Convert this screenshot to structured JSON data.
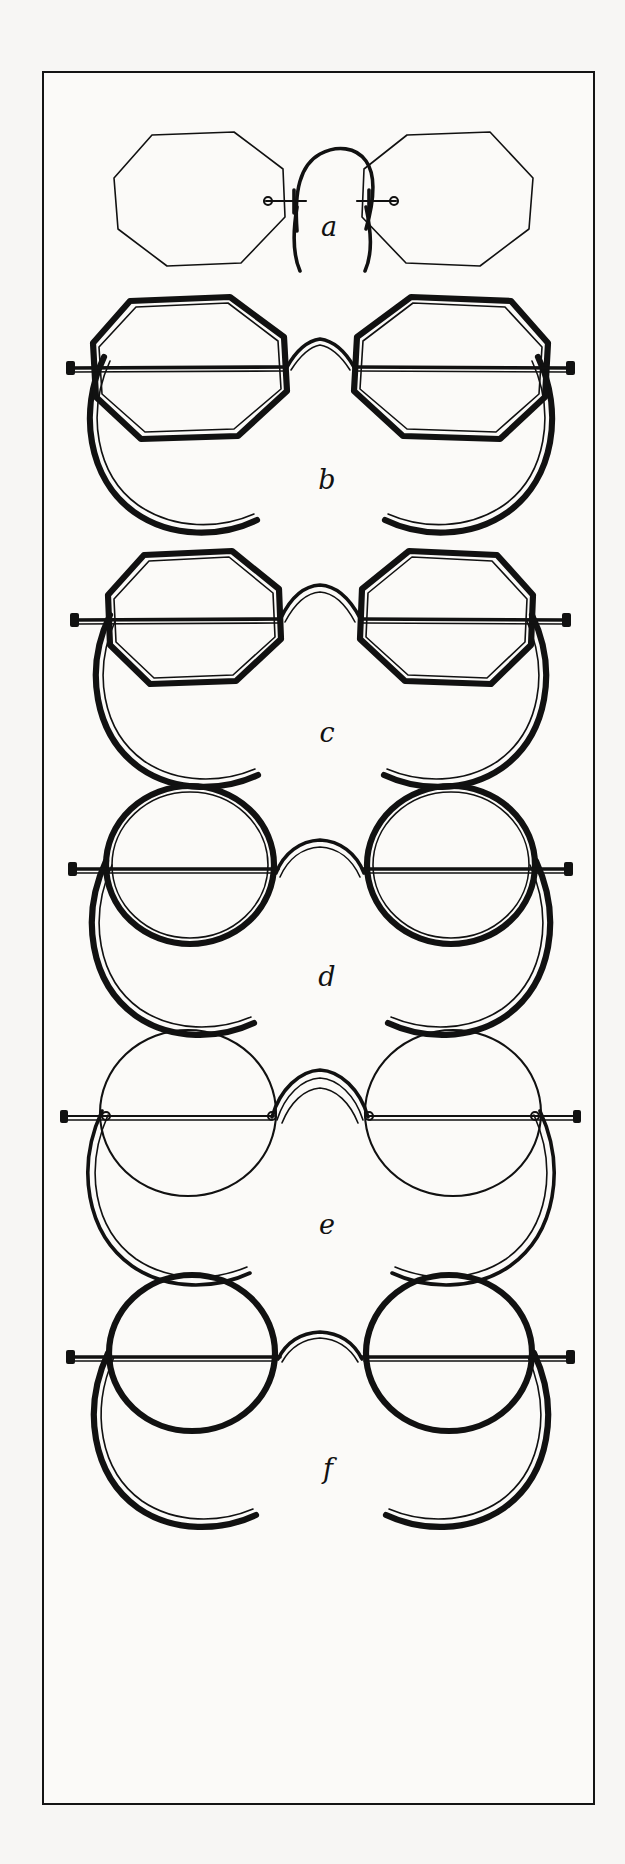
{
  "plate": {
    "title": "Spectacle and Eyeglass Frame Shapes",
    "medium": "pen-and-ink line engraving",
    "background_color": "#f7f6f4",
    "ink_color": "#111111",
    "border": {
      "style": "single thin rectangular rule",
      "color": "#141414",
      "thickness_px": 2.5,
      "x": 42,
      "y": 71,
      "width": 553,
      "height": 1734
    },
    "figure_count": 6,
    "label_style": "lowercase italic script letters"
  },
  "figures": [
    {
      "key": "a",
      "label": "a",
      "lens_shape": "octagon",
      "frame_weight": "hairline",
      "has_temples": false,
      "nose_piece": "pince-nez spring bridge",
      "description": "Octagonal rimless pince-nez eyeglasses with a looped spring bridge and screw-stud lens mounts; no temple arms.",
      "label_x": 305,
      "label_y": 198,
      "top": 20,
      "height": 210,
      "lens_rx": 82,
      "lens_ry": 76,
      "lens_cy": 100,
      "left_cx": 148,
      "right_cx": 405
    },
    {
      "key": "b",
      "label": "b",
      "lens_shape": "octagon",
      "frame_weight": "bold",
      "has_temples": true,
      "nose_piece": "arched saddle bridge",
      "description": "Large octagonal spectacles with heavy rims, a low arched bridge and long curl-side temple arms sweeping down and around.",
      "label_x": 305,
      "label_y": 410,
      "top": 210,
      "height": 270,
      "lens_rx": 86,
      "lens_ry": 78,
      "lens_cy": 82,
      "left_cx": 142,
      "right_cx": 411
    },
    {
      "key": "c",
      "label": "c",
      "lens_shape": "octagon",
      "frame_weight": "bold",
      "has_temples": true,
      "nose_piece": "arched saddle bridge",
      "description": "Smaller octagonal spectacles with heavy rims, raised arched bridge and curl-side temple arms.",
      "label_x": 305,
      "label_y": 655,
      "top": 455,
      "height": 270,
      "lens_rx": 78,
      "lens_ry": 71,
      "lens_cy": 82,
      "left_cx": 148,
      "right_cx": 405
    },
    {
      "key": "d",
      "label": "d",
      "lens_shape": "round",
      "frame_weight": "bold",
      "has_temples": true,
      "nose_piece": "arched saddle bridge",
      "description": "Round spectacles with heavy circular rims, arched bridge and full curl-side temple arms.",
      "label_x": 305,
      "label_y": 900,
      "top": 700,
      "height": 270,
      "lens_rx": 80,
      "lens_ry": 76,
      "lens_cy": 82,
      "left_cx": 145,
      "right_cx": 408
    },
    {
      "key": "e",
      "label": "e",
      "lens_shape": "round",
      "frame_weight": "hairline",
      "has_temples": true,
      "nose_piece": "arched saddle bridge",
      "description": "Round spectacles with very fine wire rims, a high arched bridge, screw studs at the joints and curl-side temple arms.",
      "label_x": 305,
      "label_y": 1138,
      "top": 943,
      "height": 270,
      "lens_rx": 84,
      "lens_ry": 80,
      "lens_cy": 85,
      "left_cx": 144,
      "right_cx": 409
    },
    {
      "key": "f",
      "label": "f",
      "lens_shape": "round",
      "frame_weight": "medium",
      "has_temples": true,
      "nose_piece": "low arched bridge",
      "description": "Round spectacles with medium-weight rims, a shallow arched bridge and curl-side temple arms.",
      "label_x": 305,
      "label_y": 1386,
      "top": 1190,
      "height": 270,
      "lens_rx": 79,
      "lens_ry": 75,
      "lens_cy": 80,
      "left_cx": 147,
      "right_cx": 406
    }
  ]
}
